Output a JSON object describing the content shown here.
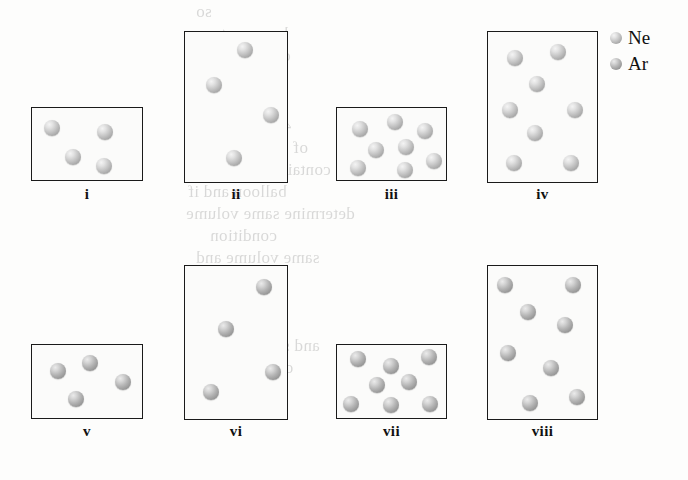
{
  "figure": {
    "type": "particle-diagram",
    "box_border_color": "#1a1a1a",
    "box_fill_color": "#fbfbfa",
    "page_background": "#fdfdfc"
  },
  "legend": {
    "x": 610,
    "y": 28,
    "entries": [
      {
        "label": "Ne",
        "species": "neon",
        "color": "#c6c6c6",
        "swatch_name": "ne-swatch"
      },
      {
        "label": "Ar",
        "species": "argon",
        "color": "#b4b4b4",
        "swatch_name": "ar-swatch"
      }
    ]
  },
  "chart_data": {
    "type": "scatter",
    "title": "",
    "xlabel": "",
    "ylabel": "",
    "containers": [
      {
        "label": "i",
        "species": "Ne",
        "particle_count": 4,
        "box": {
          "x": 31,
          "y": 107,
          "w": 112,
          "h": 74
        },
        "label_pos": {
          "x": 31,
          "y": 186,
          "w": 112
        },
        "particles": [
          {
            "cx": 52,
            "cy": 128,
            "r": 8
          },
          {
            "cx": 105,
            "cy": 132,
            "r": 8
          },
          {
            "cx": 73,
            "cy": 157,
            "r": 8
          },
          {
            "cx": 104,
            "cy": 166,
            "r": 8
          }
        ]
      },
      {
        "label": "ii",
        "species": "Ne",
        "particle_count": 4,
        "box": {
          "x": 184,
          "y": 31,
          "w": 104,
          "h": 152
        },
        "label_pos": {
          "x": 184,
          "y": 186,
          "w": 104
        },
        "particles": [
          {
            "cx": 245,
            "cy": 50,
            "r": 8
          },
          {
            "cx": 214,
            "cy": 85,
            "r": 8
          },
          {
            "cx": 271,
            "cy": 115,
            "r": 8
          },
          {
            "cx": 234,
            "cy": 158,
            "r": 8
          }
        ]
      },
      {
        "label": "iii",
        "species": "Ne",
        "particle_count": 8,
        "box": {
          "x": 336,
          "y": 107,
          "w": 111,
          "h": 74
        },
        "label_pos": {
          "x": 336,
          "y": 186,
          "w": 111
        },
        "particles": [
          {
            "cx": 360,
            "cy": 129,
            "r": 8
          },
          {
            "cx": 395,
            "cy": 122,
            "r": 8
          },
          {
            "cx": 425,
            "cy": 131,
            "r": 8
          },
          {
            "cx": 376,
            "cy": 150,
            "r": 8
          },
          {
            "cx": 406,
            "cy": 147,
            "r": 8
          },
          {
            "cx": 434,
            "cy": 161,
            "r": 8
          },
          {
            "cx": 358,
            "cy": 168,
            "r": 8
          },
          {
            "cx": 405,
            "cy": 170,
            "r": 8
          }
        ]
      },
      {
        "label": "iv",
        "species": "Ne",
        "particle_count": 8,
        "box": {
          "x": 487,
          "y": 31,
          "w": 111,
          "h": 152
        },
        "label_pos": {
          "x": 487,
          "y": 186,
          "w": 111
        },
        "particles": [
          {
            "cx": 515,
            "cy": 58,
            "r": 8
          },
          {
            "cx": 558,
            "cy": 52,
            "r": 8
          },
          {
            "cx": 537,
            "cy": 84,
            "r": 8
          },
          {
            "cx": 510,
            "cy": 110,
            "r": 8
          },
          {
            "cx": 575,
            "cy": 110,
            "r": 8
          },
          {
            "cx": 535,
            "cy": 133,
            "r": 8
          },
          {
            "cx": 514,
            "cy": 163,
            "r": 8
          },
          {
            "cx": 571,
            "cy": 163,
            "r": 8
          }
        ]
      },
      {
        "label": "v",
        "species": "Ar",
        "particle_count": 4,
        "box": {
          "x": 31,
          "y": 344,
          "w": 112,
          "h": 75
        },
        "label_pos": {
          "x": 31,
          "y": 423,
          "w": 112
        },
        "particles": [
          {
            "cx": 58,
            "cy": 371,
            "r": 8
          },
          {
            "cx": 90,
            "cy": 363,
            "r": 8
          },
          {
            "cx": 123,
            "cy": 382,
            "r": 8
          },
          {
            "cx": 76,
            "cy": 399,
            "r": 8
          }
        ]
      },
      {
        "label": "vi",
        "species": "Ar",
        "particle_count": 4,
        "box": {
          "x": 184,
          "y": 265,
          "w": 104,
          "h": 155
        },
        "label_pos": {
          "x": 184,
          "y": 423,
          "w": 104
        },
        "particles": [
          {
            "cx": 264,
            "cy": 287,
            "r": 8
          },
          {
            "cx": 226,
            "cy": 329,
            "r": 8
          },
          {
            "cx": 273,
            "cy": 372,
            "r": 8
          },
          {
            "cx": 211,
            "cy": 392,
            "r": 8
          }
        ]
      },
      {
        "label": "vii",
        "species": "Ar",
        "particle_count": 8,
        "box": {
          "x": 336,
          "y": 344,
          "w": 111,
          "h": 75
        },
        "label_pos": {
          "x": 336,
          "y": 423,
          "w": 111
        },
        "particles": [
          {
            "cx": 358,
            "cy": 359,
            "r": 8
          },
          {
            "cx": 391,
            "cy": 366,
            "r": 8
          },
          {
            "cx": 429,
            "cy": 357,
            "r": 8
          },
          {
            "cx": 377,
            "cy": 385,
            "r": 8
          },
          {
            "cx": 409,
            "cy": 382,
            "r": 8
          },
          {
            "cx": 351,
            "cy": 404,
            "r": 8
          },
          {
            "cx": 391,
            "cy": 405,
            "r": 8
          },
          {
            "cx": 430,
            "cy": 404,
            "r": 8
          }
        ]
      },
      {
        "label": "viii",
        "species": "Ar",
        "particle_count": 8,
        "box": {
          "x": 487,
          "y": 265,
          "w": 111,
          "h": 155
        },
        "label_pos": {
          "x": 487,
          "y": 423,
          "w": 111
        },
        "particles": [
          {
            "cx": 505,
            "cy": 285,
            "r": 8
          },
          {
            "cx": 573,
            "cy": 285,
            "r": 8
          },
          {
            "cx": 528,
            "cy": 312,
            "r": 8
          },
          {
            "cx": 565,
            "cy": 325,
            "r": 8
          },
          {
            "cx": 508,
            "cy": 353,
            "r": 8
          },
          {
            "cx": 551,
            "cy": 368,
            "r": 8
          },
          {
            "cx": 530,
            "cy": 403,
            "r": 8
          },
          {
            "cx": 577,
            "cy": 397,
            "r": 8
          }
        ]
      }
    ]
  },
  "background_bleed": {
    "visible": true,
    "lines": [
      {
        "x": 196,
        "y": 2,
        "text": "so"
      },
      {
        "x": 212,
        "y": 24,
        "text": "happens to"
      },
      {
        "x": 230,
        "y": 46,
        "text": "compare"
      },
      {
        "x": 238,
        "y": 68,
        "text": "at"
      },
      {
        "x": 200,
        "y": 116,
        "text": "46. Compare"
      },
      {
        "x": 186,
        "y": 138,
        "text": "of equal volumes"
      },
      {
        "x": 196,
        "y": 160,
        "text": "containers. Choose"
      },
      {
        "x": 188,
        "y": 182,
        "text": "balloon and if"
      },
      {
        "x": 186,
        "y": 204,
        "text": "determine same volume"
      },
      {
        "x": 210,
        "y": 226,
        "text": "condition"
      },
      {
        "x": 196,
        "y": 248,
        "text": "same volume and"
      },
      {
        "x": 192,
        "y": 270,
        "text": "double their"
      },
      {
        "x": 198,
        "y": 314,
        "text": "what the"
      },
      {
        "x": 190,
        "y": 336,
        "text": "and same pressure"
      },
      {
        "x": 184,
        "y": 358,
        "text": "observe the gas"
      }
    ]
  }
}
